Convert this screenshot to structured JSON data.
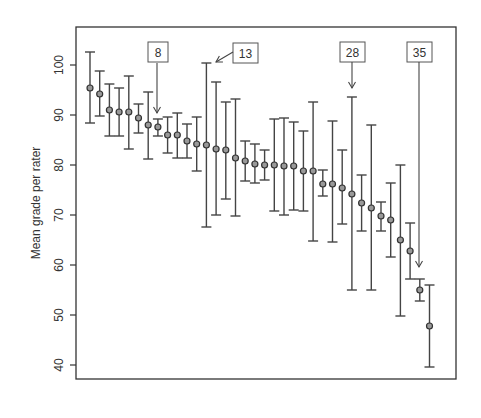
{
  "chart_data": {
    "type": "errorbar",
    "title": "",
    "xlabel": "",
    "ylabel": "Mean grade per rater",
    "ylim": [
      37.3,
      107.6
    ],
    "yticks": [
      40,
      50,
      60,
      70,
      80,
      90,
      100
    ],
    "grid": false,
    "legend": null,
    "x": [
      1,
      2,
      3,
      4,
      5,
      6,
      7,
      8,
      9,
      10,
      11,
      12,
      13,
      14,
      15,
      16,
      17,
      18,
      19,
      20,
      21,
      22,
      23,
      24,
      25,
      26,
      27,
      28,
      29,
      30,
      31,
      32,
      33,
      34,
      35,
      36
    ],
    "means": [
      95.4,
      94.2,
      91.0,
      90.6,
      90.6,
      89.4,
      88.0,
      87.6,
      86.0,
      86.0,
      84.8,
      84.2,
      84.0,
      83.2,
      83.0,
      81.4,
      80.8,
      80.2,
      80.0,
      80.0,
      79.8,
      79.8,
      78.8,
      78.8,
      76.2,
      76.2,
      75.4,
      74.2,
      72.4,
      71.4,
      69.8,
      69.0,
      65.0,
      62.8,
      55.0,
      47.8
    ],
    "lower": [
      88.4,
      89.8,
      85.8,
      85.8,
      83.2,
      86.4,
      81.2,
      85.8,
      82.4,
      81.4,
      81.4,
      78.8,
      67.6,
      70.0,
      73.2,
      69.8,
      76.8,
      76.4,
      77.0,
      70.8,
      70.0,
      71.0,
      70.8,
      64.8,
      73.8,
      64.6,
      68.2,
      55.0,
      66.8,
      55.0,
      66.8,
      61.6,
      49.8,
      57.2,
      52.8,
      39.6
    ],
    "upper": [
      102.6,
      98.8,
      96.2,
      95.4,
      97.8,
      92.2,
      94.6,
      89.2,
      89.6,
      90.4,
      88.2,
      89.6,
      100.4,
      96.6,
      92.6,
      93.2,
      84.8,
      84.2,
      83.0,
      89.2,
      89.4,
      88.6,
      86.8,
      92.6,
      79.0,
      88.8,
      83.0,
      93.6,
      78.0,
      88.0,
      72.6,
      76.4,
      80.0,
      68.4,
      57.2,
      56.0
    ],
    "annotations": [
      {
        "label": "8",
        "point_index": 8
      },
      {
        "label": "13",
        "point_index": 13
      },
      {
        "label": "28",
        "point_index": 28
      },
      {
        "label": "35",
        "point_index": 35
      }
    ]
  }
}
